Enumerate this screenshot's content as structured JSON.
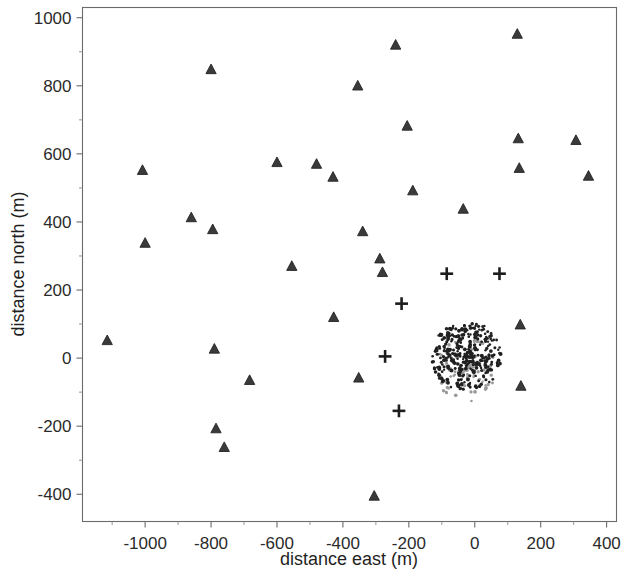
{
  "chart_data": {
    "type": "scatter",
    "title": "",
    "xlabel": "distance east (m)",
    "ylabel": "distance north (m)",
    "xlim": [
      -1190,
      430
    ],
    "ylim": [
      -480,
      1030
    ],
    "xticks": [
      -1000,
      -800,
      -600,
      -400,
      -200,
      0,
      200,
      400
    ],
    "xtick_labels": [
      "-1000",
      "-800",
      "-600",
      "-400",
      "-200",
      "0",
      "200",
      "400"
    ],
    "yticks": [
      -400,
      -200,
      0,
      200,
      400,
      600,
      800,
      1000
    ],
    "ytick_labels": [
      "-400",
      "-200",
      "0",
      "200",
      "400",
      "600",
      "800",
      "1000"
    ],
    "grid": false,
    "legend": null,
    "frame": "box",
    "series": [
      {
        "name": "triangle-markers",
        "marker": "triangle",
        "color": "#3a3a3a",
        "points": [
          [
            -1115,
            52
          ],
          [
            -1008,
            552
          ],
          [
            -1000,
            338
          ],
          [
            -860,
            413
          ],
          [
            -800,
            848
          ],
          [
            -795,
            378
          ],
          [
            -790,
            27
          ],
          [
            -785,
            -207
          ],
          [
            -760,
            -262
          ],
          [
            -683,
            -65
          ],
          [
            -600,
            575
          ],
          [
            -555,
            270
          ],
          [
            -480,
            570
          ],
          [
            -430,
            532
          ],
          [
            -428,
            120
          ],
          [
            -355,
            800
          ],
          [
            -352,
            -58
          ],
          [
            -340,
            372
          ],
          [
            -305,
            -405
          ],
          [
            -288,
            292
          ],
          [
            -280,
            252
          ],
          [
            -240,
            920
          ],
          [
            -205,
            682
          ],
          [
            -188,
            492
          ],
          [
            -35,
            438
          ],
          [
            129,
            952
          ],
          [
            132,
            645
          ],
          [
            135,
            558
          ],
          [
            138,
            98
          ],
          [
            140,
            -82
          ],
          [
            307,
            640
          ],
          [
            345,
            535
          ]
        ]
      },
      {
        "name": "plus-markers",
        "marker": "plus",
        "color": "#1d1d1d",
        "points": [
          [
            -85,
            248
          ],
          [
            75,
            248
          ],
          [
            -222,
            160
          ],
          [
            -272,
            5
          ],
          [
            -230,
            -155
          ]
        ]
      },
      {
        "name": "dense-cluster-dark",
        "marker": "dot",
        "color": "#202020",
        "description": "dense cluster of small dots centered near (-25, 5) with radius about 105 m",
        "center": [
          -25,
          5
        ],
        "radius": 105,
        "count": 330
      },
      {
        "name": "dense-cluster-gray",
        "marker": "dot",
        "color": "#9a9a9a",
        "description": "lighter gray dots concentrated in the lower half of the dense cluster",
        "center": [
          -25,
          -35
        ],
        "radius": 95,
        "count": 90
      }
    ]
  },
  "axes": {
    "x_title": "distance east (m)",
    "y_title": "distance north (m)"
  }
}
